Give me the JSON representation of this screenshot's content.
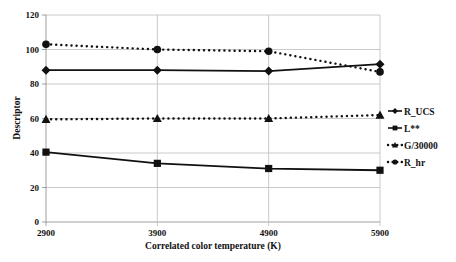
{
  "chart_data": {
    "type": "line",
    "title": "",
    "xlabel": "Correlated color temperature (K)",
    "ylabel": "Descriptor",
    "x": [
      2900,
      3900,
      4900,
      5900
    ],
    "categories": [
      "2900",
      "3900",
      "4900",
      "5900"
    ],
    "ylim": [
      0,
      120
    ],
    "yticks": [
      0,
      20,
      40,
      60,
      80,
      100,
      120
    ],
    "grid": true,
    "legend_position": "right",
    "series": [
      {
        "name": "R_UCS",
        "values": [
          88,
          88,
          87.5,
          91.5
        ],
        "marker": "diamond",
        "line": "solid"
      },
      {
        "name": "L**",
        "values": [
          40.5,
          34,
          31,
          30
        ],
        "marker": "square",
        "line": "solid"
      },
      {
        "name": "G/30000",
        "values": [
          59.5,
          60,
          60,
          62
        ],
        "marker": "triangle",
        "line": "dotted"
      },
      {
        "name": "R_hr",
        "values": [
          103,
          100,
          99,
          87
        ],
        "marker": "circle",
        "line": "dotted"
      }
    ]
  },
  "colors": {
    "series": "#111111",
    "grid": "#bdbdbd",
    "axis": "#888888"
  }
}
